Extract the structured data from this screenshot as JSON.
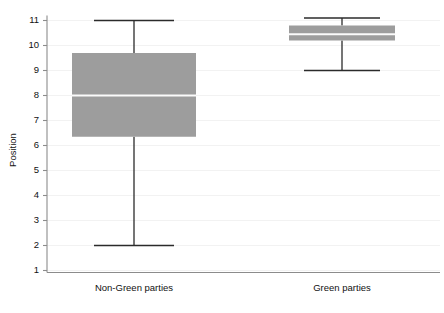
{
  "chart_data": {
    "type": "box",
    "title": "",
    "xlabel": "",
    "ylabel": "Position",
    "ylim": [
      1,
      11
    ],
    "y_ticks": [
      1,
      2,
      3,
      4,
      5,
      6,
      7,
      8,
      9,
      10,
      11
    ],
    "y_tick_labels": [
      "1",
      "2",
      "3",
      "4",
      "5",
      "6",
      "7",
      "8",
      "9",
      "10",
      "11"
    ],
    "grid": true,
    "legend": "none",
    "categories": [
      "Non-Green parties",
      "Green parties"
    ],
    "boxes": [
      {
        "category": "Non-Green parties",
        "whisker_low": 2.0,
        "q1": 6.35,
        "median": 8.0,
        "q3": 9.7,
        "whisker_high": 11.0
      },
      {
        "category": "Green parties",
        "whisker_low": 9.0,
        "q1": 10.2,
        "median": 10.45,
        "q3": 10.8,
        "whisker_high": 11.1
      }
    ],
    "colors": {
      "box_fill": "#9d9d9d",
      "median": "#fbfbfb",
      "whisker": "#2b2b2b",
      "axis": "#8c8c8c",
      "grid": "#f2f2f2",
      "text": "#111111",
      "background": "#ffffff"
    }
  }
}
